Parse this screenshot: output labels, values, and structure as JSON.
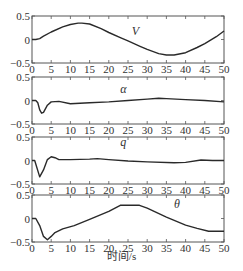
{
  "chart_data": [
    {
      "type": "line",
      "series": [
        {
          "name": "V",
          "x": [
            0,
            1,
            2,
            3,
            5,
            8,
            10,
            12,
            13,
            15,
            18,
            20,
            23,
            25,
            28,
            30,
            33,
            35,
            37,
            40,
            43,
            45,
            48,
            50
          ],
          "values": [
            0,
            0,
            0.02,
            0.07,
            0.16,
            0.27,
            0.32,
            0.35,
            0.35,
            0.33,
            0.23,
            0.15,
            0.04,
            -0.03,
            -0.14,
            -0.21,
            -0.3,
            -0.33,
            -0.33,
            -0.28,
            -0.17,
            -0.09,
            0.06,
            0.18
          ]
        }
      ],
      "label": "V",
      "label_pos": [
        26,
        0.1
      ],
      "xlim": [
        0,
        50
      ],
      "ylim": [
        -0.5,
        0.5
      ],
      "xticks": [
        0,
        5,
        10,
        15,
        20,
        25,
        30,
        35,
        40,
        45,
        50
      ],
      "yticks": [
        0.5,
        0,
        -0.5
      ],
      "ytick_labels": [
        "0.5",
        "0",
        "−0.5"
      ]
    },
    {
      "type": "line",
      "series": [
        {
          "name": "α",
          "x": [
            0,
            1,
            1.5,
            2,
            2.5,
            3,
            4,
            5,
            7,
            10,
            15,
            20,
            25,
            30,
            33,
            35,
            40,
            45,
            50
          ],
          "values": [
            0,
            0,
            -0.05,
            -0.2,
            -0.27,
            -0.25,
            -0.1,
            -0.03,
            -0.02,
            -0.07,
            -0.05,
            -0.03,
            0,
            0.03,
            0.05,
            0.04,
            0.02,
            0,
            -0.03
          ]
        }
      ],
      "label": "α",
      "label_pos": [
        23,
        0.15
      ],
      "xlim": [
        0,
        50
      ],
      "ylim": [
        -0.5,
        0.5
      ],
      "xticks": [
        0,
        5,
        10,
        15,
        20,
        25,
        30,
        35,
        40,
        45,
        50
      ],
      "yticks": [
        0.5,
        0,
        -0.5
      ],
      "ytick_labels": [
        "0.5",
        "0",
        "−0.5"
      ]
    },
    {
      "type": "line",
      "series": [
        {
          "name": "q",
          "x": [
            0,
            0.7,
            2,
            3,
            4,
            5,
            6,
            7,
            10,
            15,
            17,
            20,
            25,
            30,
            37,
            40,
            44,
            47,
            50
          ],
          "values": [
            0,
            0,
            -0.35,
            -0.2,
            0.02,
            0.08,
            0.06,
            0.02,
            0.02,
            0.03,
            0.04,
            0.02,
            -0.01,
            -0.03,
            -0.05,
            -0.04,
            0.01,
            0,
            0
          ]
        }
      ],
      "label": "q",
      "label_pos": [
        23,
        0.3
      ],
      "xlim": [
        0,
        50
      ],
      "ylim": [
        -0.5,
        0.5
      ],
      "xticks": [
        0,
        5,
        10,
        15,
        20,
        25,
        30,
        35,
        40,
        45,
        50
      ],
      "yticks": [
        0.5,
        0,
        -0.5
      ],
      "ytick_labels": [
        "0.5",
        "0",
        "−0.5"
      ]
    },
    {
      "type": "line",
      "series": [
        {
          "name": "θ",
          "x": [
            0,
            1,
            2,
            3,
            4,
            5,
            6,
            8,
            11,
            15,
            20,
            23,
            28,
            30,
            35,
            40,
            43,
            46,
            50
          ],
          "values": [
            0,
            0,
            -0.15,
            -0.38,
            -0.45,
            -0.38,
            -0.3,
            -0.22,
            -0.15,
            -0.02,
            0.15,
            0.28,
            0.28,
            0.22,
            0.03,
            -0.14,
            -0.21,
            -0.27,
            -0.27
          ]
        }
      ],
      "label": "θ",
      "label_pos": [
        37,
        0.22
      ],
      "xlim": [
        0,
        50
      ],
      "ylim": [
        -0.5,
        0.5
      ],
      "xticks": [
        0,
        5,
        10,
        15,
        20,
        25,
        30,
        35,
        40,
        45,
        50
      ],
      "yticks": [
        0.5,
        0,
        -0.5
      ],
      "ytick_labels": [
        "0.5",
        "0",
        "−0.5"
      ]
    }
  ],
  "xlabel": "时间/s",
  "colors": {
    "line": "#2a2a2a",
    "axis": "#555555",
    "text": "#333333"
  }
}
